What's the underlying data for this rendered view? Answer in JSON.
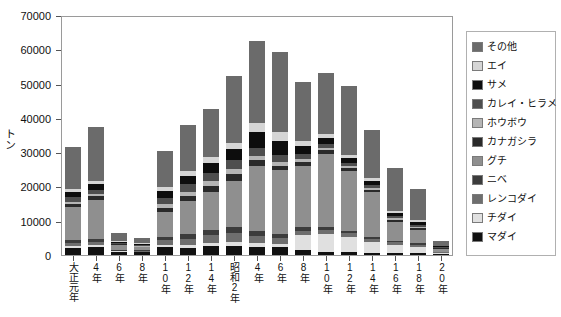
{
  "chart_data": {
    "type": "bar",
    "subtype": "stacked-vertical",
    "title": "",
    "xlabel": "",
    "ylabel": "トン",
    "ylim": [
      0,
      70000
    ],
    "ytick_labels": [
      "0",
      "10000",
      "20000",
      "30000",
      "40000",
      "50000",
      "60000",
      "70000"
    ],
    "ytick_values": [
      0,
      10000,
      20000,
      30000,
      40000,
      50000,
      60000,
      70000
    ],
    "grid": false,
    "legend_position": "right-outside",
    "categories": [
      "大正元年",
      "4年",
      "6年",
      "8年",
      "10年",
      "12年",
      "14年",
      "昭和2年",
      "4年",
      "6年",
      "8年",
      "10年",
      "12年",
      "14年",
      "16年",
      "18年",
      "20年"
    ],
    "series": [
      {
        "name": "マダイ",
        "color": "#111111",
        "values": [
          2100,
          2400,
          900,
          800,
          2300,
          2100,
          2500,
          2600,
          2400,
          2200,
          1500,
          900,
          800,
          700,
          600,
          500,
          300
        ]
      },
      {
        "name": "チダイ",
        "color": "#e0e0e0",
        "values": [
          600,
          500,
          150,
          150,
          600,
          900,
          1100,
          1300,
          1100,
          900,
          4200,
          5300,
          4600,
          3200,
          2400,
          1900,
          250
        ]
      },
      {
        "name": "レンコダイ",
        "color": "#6e6e6e",
        "values": [
          900,
          1000,
          250,
          250,
          1400,
          1800,
          2200,
          2500,
          2100,
          1800,
          1400,
          1100,
          900,
          800,
          700,
          600,
          200
        ]
      },
      {
        "name": "ニベ",
        "color": "#3c3c3c",
        "values": [
          700,
          800,
          200,
          200,
          1100,
          1400,
          1600,
          1700,
          1500,
          1300,
          1000,
          800,
          700,
          600,
          500,
          400,
          150
        ]
      },
      {
        "name": "グチ",
        "color": "#8f8f8f",
        "values": [
          9800,
          11500,
          1400,
          900,
          7200,
          9600,
          11000,
          13500,
          19000,
          18500,
          18000,
          21500,
          17500,
          13000,
          5500,
          4000,
          900
        ]
      },
      {
        "name": "カナガシラ",
        "color": "#2a2a2a",
        "values": [
          800,
          900,
          200,
          200,
          1200,
          1500,
          1700,
          1900,
          1600,
          1400,
          1100,
          900,
          800,
          700,
          600,
          450,
          150
        ]
      },
      {
        "name": "ホウボウ",
        "color": "#b5b5b5",
        "values": [
          700,
          700,
          200,
          150,
          1000,
          1200,
          1400,
          1500,
          1300,
          1100,
          900,
          700,
          600,
          500,
          400,
          350,
          120
        ]
      },
      {
        "name": "カレイ・ヒラメ",
        "color": "#4e4e4e",
        "values": [
          1400,
          1300,
          300,
          250,
          1800,
          2100,
          2400,
          2600,
          2200,
          1900,
          1500,
          1200,
          1000,
          900,
          700,
          600,
          200
        ]
      },
      {
        "name": "サメ",
        "color": "#0d0d0d",
        "values": [
          1500,
          1600,
          350,
          300,
          2100,
          2500,
          2900,
          3200,
          4800,
          4300,
          2100,
          1700,
          1400,
          1200,
          900,
          750,
          250
        ]
      },
      {
        "name": "エイ",
        "color": "#d5d5d5",
        "values": [
          800,
          900,
          250,
          200,
          1300,
          1500,
          1800,
          2000,
          2600,
          2400,
          1500,
          1200,
          1000,
          900,
          700,
          600,
          200
        ]
      },
      {
        "name": "その他",
        "color": "#6b6b6b",
        "values": [
          12200,
          15800,
          2400,
          1600,
          10500,
          13400,
          14000,
          19500,
          23800,
          23300,
          17300,
          17900,
          20100,
          14100,
          12500,
          9000,
          1280
        ]
      }
    ]
  },
  "legend": {
    "items": [
      {
        "label": "その他",
        "icon": "legend-swatch-sonota"
      },
      {
        "label": "エイ",
        "icon": "legend-swatch-ei"
      },
      {
        "label": "サメ",
        "icon": "legend-swatch-same"
      },
      {
        "label": "カレイ・ヒラメ",
        "icon": "legend-swatch-karei-hirame"
      },
      {
        "label": "ホウボウ",
        "icon": "legend-swatch-houbou"
      },
      {
        "label": "カナガシラ",
        "icon": "legend-swatch-kanagashira"
      },
      {
        "label": "グチ",
        "icon": "legend-swatch-guchi"
      },
      {
        "label": "ニベ",
        "icon": "legend-swatch-nibe"
      },
      {
        "label": "レンコダイ",
        "icon": "legend-swatch-renkodai"
      },
      {
        "label": "チダイ",
        "icon": "legend-swatch-chidai"
      },
      {
        "label": "マダイ",
        "icon": "legend-swatch-madai"
      }
    ]
  }
}
